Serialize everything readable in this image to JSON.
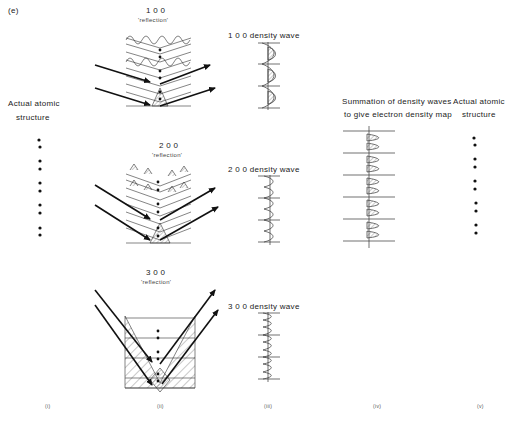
{
  "panel_label": "(e)",
  "columns": {
    "i": {
      "label": "(i)",
      "title_line1": "Actual atomic",
      "title_line2": "structure"
    },
    "ii": {
      "label": "(ii)"
    },
    "iii": {
      "label": "(iii)"
    },
    "iv": {
      "label": "(iv)",
      "title_line1": "Summation of density waves",
      "title_line2": "to give electron density map"
    },
    "v": {
      "label": "(v)",
      "title_line1": "Actual atomic",
      "title_line2": "structure"
    }
  },
  "reflections": [
    {
      "index": "1 0 0",
      "caption": "'reflection'",
      "wave_label": "1 0 0 density wave"
    },
    {
      "index": "2 0 0",
      "caption": "'reflection'",
      "wave_label": "2 0 0 density wave"
    },
    {
      "index": "3 0 0",
      "caption": "'reflection'",
      "wave_label": "3 0 0 density wave"
    }
  ],
  "colors": {
    "ink": "#222222",
    "background": "#ffffff"
  }
}
